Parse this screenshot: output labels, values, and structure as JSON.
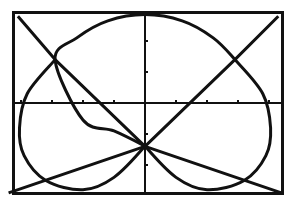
{
  "chart_data": {
    "type": "line",
    "title": "",
    "xlabel": "",
    "ylabel": "",
    "grid": false,
    "legend": null,
    "xlim": [
      -4.3,
      4.4
    ],
    "ylim": [
      -2.9,
      2.9
    ],
    "x_tick_spacing": 1,
    "y_tick_spacing": 1,
    "x_ticks": [
      -4,
      -3,
      -2,
      -1,
      1,
      2,
      3,
      4
    ],
    "y_ticks": [
      -2,
      -1,
      1,
      2
    ],
    "series": [
      {
        "name": "line-1",
        "kind": "line",
        "equation": "y = -x - 1.4",
        "points": [
          [
            -4.1,
            2.8
          ],
          [
            -2.9,
            1.4
          ],
          [
            0,
            -1.4
          ],
          [
            4.4,
            -2.9
          ]
        ]
      },
      {
        "name": "line-2",
        "kind": "line",
        "equation": "y = x - 1.4",
        "points": [
          [
            -4.4,
            -2.9
          ],
          [
            0,
            -1.4
          ],
          [
            2.9,
            1.4
          ],
          [
            4.3,
            2.8
          ]
        ]
      },
      {
        "name": "heart-curve",
        "kind": "closed-curve",
        "points": [
          [
            0,
            -1.39
          ],
          [
            -1.0,
            -0.9
          ],
          [
            -2.0,
            -0.55
          ],
          [
            -2.9,
            1.4
          ],
          [
            -2.2,
            2.1
          ],
          [
            -1.2,
            2.65
          ],
          [
            0,
            2.85
          ],
          [
            1.2,
            2.65
          ],
          [
            2.2,
            2.1
          ],
          [
            2.9,
            1.4
          ],
          [
            3.8,
            0.3
          ],
          [
            4.05,
            -0.8
          ],
          [
            3.9,
            -1.7
          ],
          [
            3.2,
            -2.5
          ],
          [
            2.0,
            -2.8
          ],
          [
            1.0,
            -2.4
          ],
          [
            0,
            -1.39
          ],
          [
            -1.0,
            -2.4
          ],
          [
            -2.0,
            -2.8
          ],
          [
            -3.2,
            -2.5
          ],
          [
            -3.9,
            -1.7
          ],
          [
            -4.05,
            -0.8
          ],
          [
            -3.8,
            0.3
          ],
          [
            -2.9,
            1.4
          ]
        ]
      }
    ],
    "intersections": [
      [
        -2.9,
        1.4
      ],
      [
        2.9,
        1.4
      ],
      [
        0,
        -1.4
      ]
    ]
  },
  "colors": {
    "background": "#ffffff",
    "ink": "#111111"
  }
}
